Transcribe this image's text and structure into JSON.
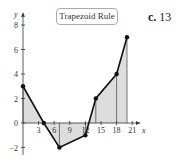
{
  "title_box": "Trapezoid Rule",
  "answer": {
    "label": "c.",
    "value": "13"
  },
  "chart_data": {
    "type": "line",
    "title": "Trapezoid Rule",
    "xlabel": "x",
    "ylabel": "y",
    "x": [
      0,
      4,
      7,
      12,
      14,
      18,
      20
    ],
    "series": [
      {
        "name": "f(x)",
        "values": [
          3,
          0,
          -2,
          -1,
          2,
          4,
          7
        ]
      }
    ],
    "x_ticks": [
      3,
      6,
      9,
      12,
      15,
      18,
      21
    ],
    "y_ticks": [
      -2,
      0,
      2,
      4,
      6,
      8
    ],
    "xlim": [
      0,
      22
    ],
    "ylim": [
      -2.5,
      9
    ],
    "fill": "trapezoids shaded gray",
    "grid": false
  }
}
